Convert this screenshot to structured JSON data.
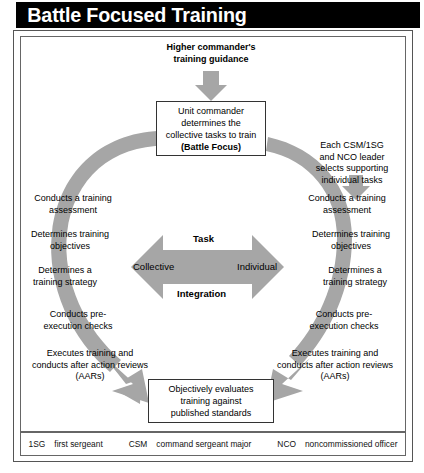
{
  "title": "Battle Focused Training",
  "diagram": {
    "top_input": "Higher commander's\ntraining guidance",
    "center_box": {
      "line1": "Unit commander",
      "line2": "determines the",
      "line3": "collective tasks to train",
      "line4": "(Battle Focus)"
    },
    "right_branch_note": "Each CSM/1SG\nand NCO leader\nselects supporting\nindividual tasks",
    "bottom_box": {
      "line1": "Objectively evaluates",
      "line2": "training against",
      "line3": "published standards"
    },
    "center_arrow": {
      "top_label": "Task",
      "bottom_label": "Integration",
      "left_label": "Collective",
      "right_label": "Individual"
    },
    "left_steps": [
      "Conducts a training\nassessment",
      "Determines training\nobjectives",
      "Determines a\ntraining strategy",
      "Conducts pre-\nexecution checks",
      "Executes training and\nconducts after action reviews\n(AARs)"
    ],
    "right_steps": [
      "Conducts a training\nassessment",
      "Determines training\nobjectives",
      "Determines a\ntraining strategy",
      "Conducts pre-\nexecution checks",
      "Executes training and\nconducts after action reviews\n(AARs)"
    ]
  },
  "legend": [
    {
      "abbr": "1SG",
      "term": "first sergeant"
    },
    {
      "abbr": "CSM",
      "term": "command sergeant major"
    },
    {
      "abbr": "NCO",
      "term": "noncommissioned officer"
    }
  ],
  "colors": {
    "arrow_gray": "#a6a6a6",
    "title_bg": "#000000",
    "title_fg": "#ffffff",
    "frame": "#666666"
  }
}
